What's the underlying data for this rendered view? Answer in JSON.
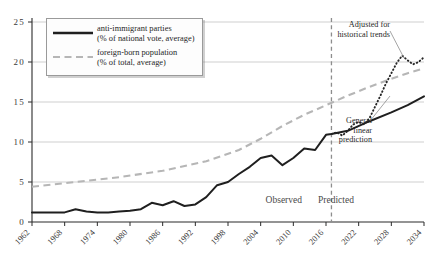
{
  "chart_data": {
    "type": "line",
    "title": "",
    "xlabel": "",
    "ylabel": "",
    "xlim": [
      1962,
      2034
    ],
    "ylim": [
      0,
      25
    ],
    "grid": true,
    "legend_position": "top-left",
    "y_ticks": [
      "0",
      "5",
      "10",
      "15",
      "20",
      "25"
    ],
    "x_ticks": [
      "1962",
      "1968",
      "1974",
      "1980",
      "1986",
      "1992",
      "1998",
      "2004",
      "2010",
      "2016",
      "2022",
      "2028",
      "2034"
    ],
    "zones": [
      {
        "label": "Observed",
        "from": 1962,
        "to": 2017
      },
      {
        "label": "Predicted",
        "from": 2017,
        "to": 2034
      }
    ],
    "divider_year": 2017,
    "series": [
      {
        "name": "anti-immigrant parties",
        "sublabel": "(% of national vote, average)",
        "style": "solid",
        "color": "#1f1f1f",
        "x": [
          1962,
          1964,
          1966,
          1968,
          1970,
          1972,
          1974,
          1976,
          1978,
          1980,
          1982,
          1984,
          1986,
          1988,
          1990,
          1992,
          1994,
          1996,
          1998,
          2000,
          2002,
          2004,
          2006,
          2008,
          2010,
          2012,
          2014,
          2016,
          2017,
          2020,
          2024,
          2028,
          2031,
          2034
        ],
        "y": [
          1.2,
          1.2,
          1.2,
          1.2,
          1.6,
          1.3,
          1.2,
          1.2,
          1.3,
          1.4,
          1.6,
          2.4,
          2.1,
          2.6,
          2.0,
          2.2,
          3.1,
          4.6,
          5.0,
          6.0,
          6.9,
          8.0,
          8.3,
          7.1,
          8.0,
          9.2,
          9.0,
          10.9,
          11.0,
          11.4,
          12.6,
          13.7,
          14.6,
          15.7
        ]
      },
      {
        "name": "foreign-born population",
        "sublabel": "(% of total, average)",
        "style": "dashed",
        "color": "#b6b6b6",
        "x": [
          1962,
          1970,
          1978,
          1986,
          1994,
          2000,
          2004,
          2008,
          2012,
          2016,
          2020,
          2024,
          2028,
          2031,
          2034
        ],
        "y": [
          4.4,
          5.0,
          5.6,
          6.4,
          7.6,
          9.0,
          10.4,
          12.0,
          13.4,
          14.6,
          15.8,
          16.9,
          17.9,
          18.6,
          19.2
        ]
      },
      {
        "name": "Adjusted for historical trends",
        "sublabel": "",
        "style": "dotted",
        "color": "#262626",
        "x": [
          2017,
          2018,
          2019,
          2020,
          2021,
          2022,
          2023,
          2024,
          2025,
          2026,
          2027,
          2028,
          2029,
          2030,
          2031,
          2032,
          2033,
          2034
        ],
        "y": [
          11.0,
          11.2,
          10.8,
          11.4,
          12.2,
          12.5,
          12.2,
          13.0,
          14.4,
          15.8,
          17.3,
          18.6,
          19.9,
          20.8,
          20.2,
          19.7,
          20.0,
          20.6
        ]
      }
    ],
    "annotations": [
      {
        "text_line1": "Adjusted for",
        "text_line2": "historical trends",
        "target": "dotted-series"
      },
      {
        "text_line1": "General",
        "text_line2": "linear",
        "text_line3": "prediction",
        "target": "solid-series"
      }
    ]
  },
  "legend": {
    "entries": [
      {
        "label": "anti-immigrant parties",
        "sublabel": "(% of national vote, average)"
      },
      {
        "label": "foreign-born population",
        "sublabel": "(% of total, average)"
      }
    ]
  },
  "annot1": {
    "l1": "Adjusted for",
    "l2": "historical trends"
  },
  "annot2": {
    "l1": "General",
    "l2": "linear",
    "l3": "prediction"
  },
  "zone": {
    "observed": "Observed",
    "predicted": "Predicted"
  },
  "colors": {
    "solid": "#1f1f1f",
    "dashed": "#b6b6b6",
    "dotted": "#262626",
    "grid": "#c9c9c9",
    "axis": "#2b2b2b",
    "divider": "#8d8d8d"
  }
}
